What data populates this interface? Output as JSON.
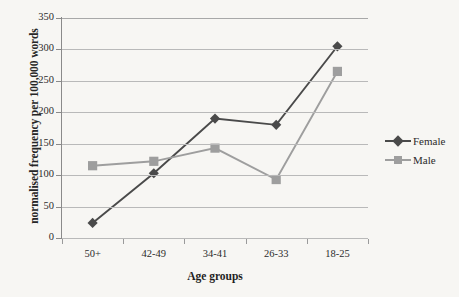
{
  "chart_data": {
    "type": "line",
    "title": "",
    "xlabel": "Age groups",
    "ylabel": "normalised frequency per 100,000 words",
    "categories": [
      "50+",
      "42-49",
      "34-41",
      "26-33",
      "18-25"
    ],
    "series": [
      {
        "name": "Female",
        "color": "#4a4a4a",
        "marker": "diamond",
        "values": [
          24,
          103,
          190,
          180,
          305
        ]
      },
      {
        "name": "Male",
        "color": "#9e9e9e",
        "marker": "square",
        "values": [
          115,
          122,
          143,
          93,
          265
        ]
      }
    ],
    "ylim": [
      0,
      350
    ],
    "yticks": [
      0,
      50,
      100,
      150,
      200,
      250,
      300,
      350
    ],
    "ytick_labels": [
      "0",
      "50",
      "100",
      "150",
      "200",
      "250",
      "300",
      "350"
    ],
    "grid": true,
    "grid_axis": "y",
    "legend_position": "right",
    "legend": [
      "Female",
      "Male"
    ]
  },
  "colors": {
    "background": "#f7f6f3",
    "gridline": "#b9b9b9",
    "axis": "#8a8a8a",
    "female": "#4a4a4a",
    "male": "#9e9e9e",
    "text": "#2b2b2b"
  }
}
